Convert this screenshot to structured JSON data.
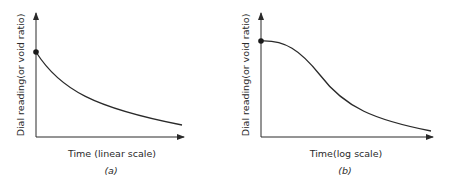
{
  "panels": [
    {
      "id": "a",
      "ylabel": "Dial reading(or void ratio)",
      "xlabel": "Time (linear scale)",
      "caption": "(a)",
      "curve_shape": "concave decay (exponential-like)"
    },
    {
      "id": "b",
      "ylabel": "Dial reading(or void ratio)",
      "xlabel": "Time(log scale)",
      "caption": "(b)",
      "curve_shape": "reverse S-curve"
    }
  ],
  "colors": {
    "line": "#2a2a2a",
    "background": "#ffffff"
  }
}
